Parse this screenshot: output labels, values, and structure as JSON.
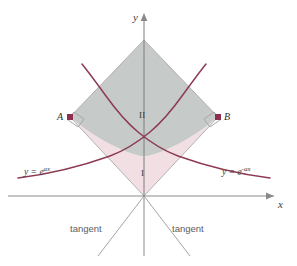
{
  "figure": {
    "type": "math-diagram",
    "background": "#ffffff"
  },
  "colors": {
    "curve": "#8d3a52",
    "point": "#8d2f4e",
    "axis": "#8a8a8a",
    "tangent_line": "#9a9a9a",
    "region_upper_fill": "#c3c8c6",
    "region_lower_fill": "#f0dde3",
    "region_stroke": "#a8aaa8",
    "label_text": "#4a4a4a"
  },
  "axes": {
    "y_label": "y",
    "x_label": "x",
    "origin": {
      "x": 144,
      "y": 196
    }
  },
  "curves": [
    {
      "id": "curve-left",
      "equation_label": "y = e",
      "exponent": "ax",
      "label_x": 24,
      "label_y": 166
    },
    {
      "id": "curve-right",
      "equation_label": "y = e",
      "exponent": "-ax",
      "label_x": 222,
      "label_y": 166
    }
  ],
  "points": [
    {
      "id": "point-a",
      "label": "A",
      "x": 70,
      "y": 117,
      "label_x": 57,
      "label_y": 112
    },
    {
      "id": "point-b",
      "label": "B",
      "x": 218,
      "y": 117,
      "label_x": 224,
      "label_y": 112
    }
  ],
  "regions": [
    {
      "id": "region-one",
      "label": "I",
      "label_x": 142,
      "label_y": 170,
      "fill": "#f0dde3"
    },
    {
      "id": "region-two",
      "label": "II",
      "label_x": 140,
      "label_y": 112,
      "fill": "#c3c8c6"
    }
  ],
  "tangent_labels": [
    {
      "id": "tangent-left",
      "label": "tangent",
      "x": 70,
      "y": 225
    },
    {
      "id": "tangent-right",
      "label": "tangent",
      "x": 172,
      "y": 225
    }
  ]
}
